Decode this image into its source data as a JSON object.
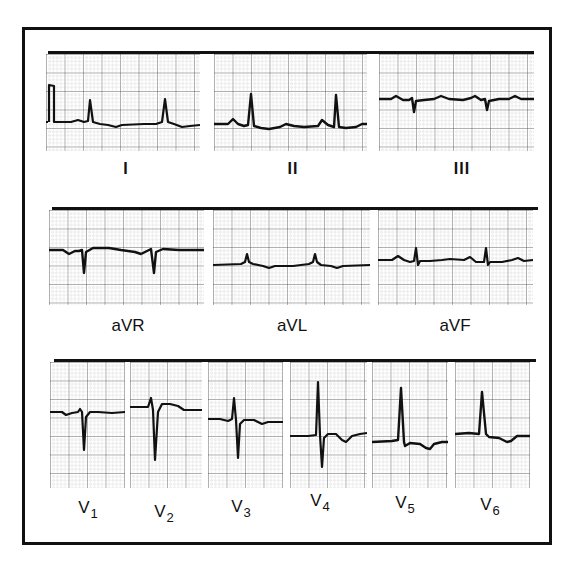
{
  "figure": {
    "colors": {
      "ink": "#111111",
      "grid_major": "#555555",
      "grid_minor": "#aaaaaa",
      "paper": "#ffffff"
    }
  },
  "rows": [
    {
      "leads": [
        {
          "id": "I",
          "label": "I",
          "sub": ""
        },
        {
          "id": "II",
          "label": "II",
          "sub": ""
        },
        {
          "id": "III",
          "label": "III",
          "sub": ""
        }
      ]
    },
    {
      "leads": [
        {
          "id": "aVR",
          "label": "aVR",
          "sub": ""
        },
        {
          "id": "aVL",
          "label": "aVL",
          "sub": ""
        },
        {
          "id": "aVF",
          "label": "aVF",
          "sub": ""
        }
      ]
    },
    {
      "leads": [
        {
          "id": "V1",
          "label": "V",
          "sub": "1"
        },
        {
          "id": "V2",
          "label": "V",
          "sub": "2"
        },
        {
          "id": "V3",
          "label": "V",
          "sub": "3"
        },
        {
          "id": "V4",
          "label": "V",
          "sub": "4"
        },
        {
          "id": "V5",
          "label": "V",
          "sub": "5"
        },
        {
          "id": "V6",
          "label": "V",
          "sub": "6"
        }
      ]
    }
  ]
}
